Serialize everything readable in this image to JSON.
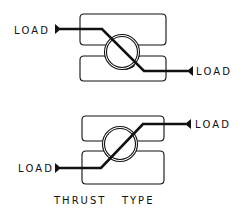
{
  "figure": {
    "caption": "THRUST   TYPE",
    "ink_color": "#111111",
    "background": "#ffffff"
  },
  "diagrams": [
    {
      "id": "upper",
      "left_label": "LOAD",
      "right_label": "LOAD",
      "load_path": "diagonal-down (left high to right low)"
    },
    {
      "id": "lower",
      "left_label": "LOAD",
      "right_label": "LOAD",
      "load_path": "diagonal-up (left low to right high)"
    }
  ]
}
